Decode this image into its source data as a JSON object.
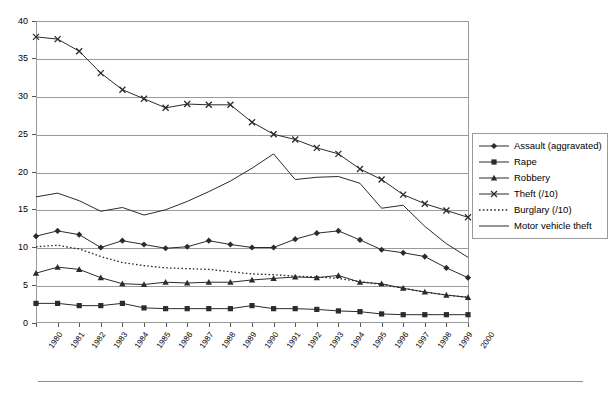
{
  "chart_data": {
    "type": "line",
    "title": "",
    "subtitle": "",
    "xlabel": "",
    "ylabel": "",
    "xlim": [
      1980,
      2000
    ],
    "ylim": [
      0,
      40
    ],
    "ytick_step": 5,
    "grid": true,
    "legend_position": "right",
    "categories": [
      "1980",
      "1981",
      "1982",
      "1983",
      "1984",
      "1985",
      "1986",
      "1987",
      "1988",
      "1989",
      "1990",
      "1991",
      "1992",
      "1993",
      "1994",
      "1995",
      "1996",
      "1997",
      "1998",
      "1999",
      "2000"
    ],
    "yticks": [
      "0",
      "5",
      "10",
      "15",
      "20",
      "25",
      "30",
      "35",
      "40"
    ],
    "series": [
      {
        "name": "Assault (aggravated)",
        "marker": "diamond",
        "line": "solid",
        "color": "#2b2b2b",
        "values": [
          11.5,
          12.2,
          11.7,
          10.0,
          10.9,
          10.4,
          9.9,
          10.1,
          10.9,
          10.4,
          10.0,
          10.0,
          11.1,
          11.9,
          12.2,
          11.0,
          9.7,
          9.3,
          8.8,
          7.3,
          6.0
        ]
      },
      {
        "name": "Rape",
        "marker": "square",
        "line": "solid",
        "color": "#2b2b2b",
        "values": [
          2.6,
          2.6,
          2.3,
          2.3,
          2.6,
          2.0,
          1.9,
          1.9,
          1.9,
          1.9,
          2.3,
          1.9,
          1.9,
          1.8,
          1.6,
          1.5,
          1.2,
          1.1,
          1.1,
          1.1,
          1.1
        ]
      },
      {
        "name": "Robbery",
        "marker": "triangle",
        "line": "solid",
        "color": "#2b2b2b",
        "values": [
          6.6,
          7.4,
          7.1,
          6.0,
          5.2,
          5.1,
          5.4,
          5.3,
          5.4,
          5.4,
          5.7,
          5.9,
          6.1,
          6.0,
          6.3,
          5.4,
          5.2,
          4.6,
          4.1,
          3.7,
          3.4
        ]
      },
      {
        "name": "Theft (/10)",
        "marker": "cross",
        "line": "solid",
        "color": "#2b2b2b",
        "values": [
          37.9,
          37.6,
          36.0,
          33.1,
          30.9,
          29.7,
          28.5,
          29.0,
          28.9,
          28.9,
          26.6,
          25.0,
          24.3,
          23.2,
          22.4,
          20.4,
          19.0,
          17.0,
          15.8,
          14.9,
          14.0
        ]
      },
      {
        "name": "Burglary (/10)",
        "marker": "none",
        "line": "dotted",
        "color": "#2b2b2b",
        "values": [
          10.1,
          10.3,
          9.8,
          8.8,
          8.0,
          7.6,
          7.3,
          7.2,
          7.1,
          6.8,
          6.5,
          6.4,
          6.2,
          6.1,
          5.9,
          5.5,
          5.1,
          4.6,
          4.1,
          3.7,
          3.4
        ]
      },
      {
        "name": "Motor vehicle theft",
        "marker": "none",
        "line": "solid",
        "color": "#2b2b2b",
        "values": [
          16.7,
          17.2,
          16.2,
          14.8,
          15.3,
          14.3,
          15.0,
          16.1,
          17.4,
          18.8,
          20.5,
          22.4,
          19.0,
          19.3,
          19.4,
          18.5,
          15.2,
          15.6,
          12.8,
          10.5,
          8.7
        ]
      }
    ]
  },
  "legend": {
    "items": [
      {
        "label": "Assault (aggravated)"
      },
      {
        "label": "Rape"
      },
      {
        "label": "Robbery"
      },
      {
        "label": "Theft (/10)"
      },
      {
        "label": "Burglary (/10)"
      },
      {
        "label": "Motor vehicle theft"
      }
    ]
  }
}
